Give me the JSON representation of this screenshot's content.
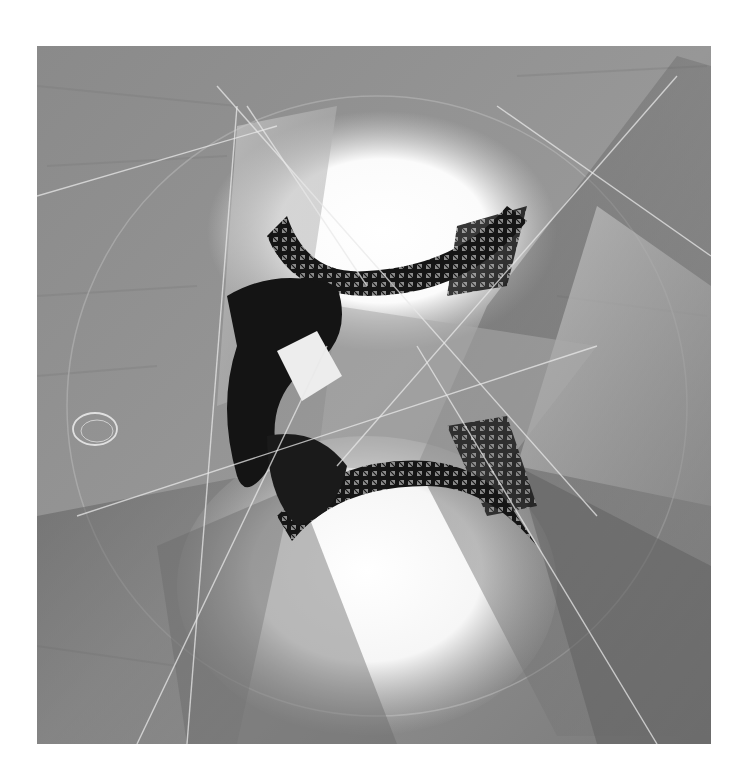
{
  "artwork": {
    "subject": "Abstract collage of the Eiffel Tower viewed from directly below",
    "palette": {
      "background": "#ffffff",
      "paper_gray": "#8e8e8e",
      "paper_dark": "#6e6e6e",
      "paper_light": "#b4b4b4",
      "ironwork": "#111111",
      "sky_glow": "#ffffff"
    },
    "bounds": {
      "x": 37,
      "y": 46,
      "width": 674,
      "height": 698
    }
  }
}
